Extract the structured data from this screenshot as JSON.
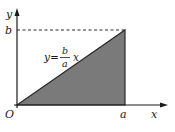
{
  "diagram": {
    "type": "area-under-line",
    "axes": {
      "x_label": "x",
      "y_label": "y",
      "origin_label": "O"
    },
    "ticks": {
      "x_tick_label": "a",
      "y_tick_label": "b"
    },
    "equation": {
      "lhs": "y=",
      "numerator": "b",
      "denominator": "a",
      "variable": "x"
    },
    "shaded_region": {
      "description": "triangle under y=(b/a)x from x=0 to x=a",
      "fill_color": "#7a7a7a"
    },
    "guide_line": {
      "style": "dashed",
      "from": "b on y-axis",
      "to": "(a, b)"
    }
  }
}
